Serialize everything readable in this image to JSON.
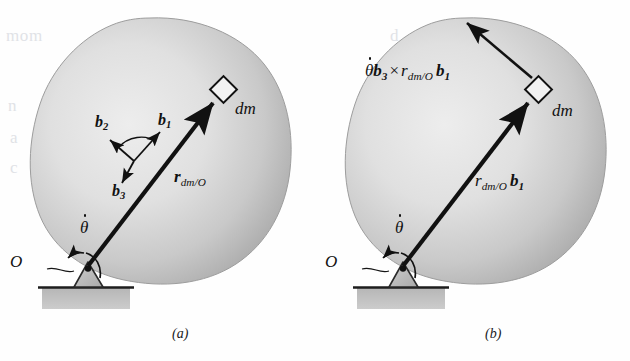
{
  "figure": {
    "kind": "physics-diagram",
    "panel_count": 2,
    "background_color": "#fefefe",
    "body_fill_light": "#e6e6e6",
    "body_fill_dark": "#a8a8a8",
    "body_edge_color": "#9a9a9a",
    "ink_color": "#111111",
    "ground_fill": "#b9b9b9",
    "support_fill": "#c4c4c4"
  },
  "panel_a": {
    "caption": "(a)",
    "origin_label": "O",
    "theta_dot": {
      "symbol": "θ",
      "accent": "dot",
      "meaning": "angular-rate"
    },
    "position_vector": {
      "r_symbol": "r",
      "r_bold": true,
      "subscript": "dm/O",
      "meaning": "position of dm relative to O"
    },
    "mass_element_label": "dm",
    "basis_vectors": [
      {
        "name": "b1",
        "symbol": "b",
        "index": "1"
      },
      {
        "name": "b2",
        "symbol": "b",
        "index": "2"
      },
      {
        "name": "b3",
        "symbol": "b",
        "index": "3"
      }
    ],
    "markers": {
      "dm_marker": "open-diamond",
      "pivot_marker": "filled-dot"
    }
  },
  "panel_b": {
    "caption": "(b)",
    "origin_label": "O",
    "theta_dot": {
      "symbol": "θ",
      "accent": "dot",
      "meaning": "angular-rate"
    },
    "position_vector": {
      "r_symbol": "r",
      "r_bold": false,
      "subscript": "dm/O",
      "unit_vector": "b",
      "unit_index": "1",
      "meaning": "r_dm/O b1"
    },
    "velocity_expression": {
      "theta_symbol": "θ",
      "theta_accent": "dot",
      "omega_unit": "b",
      "omega_index": "3",
      "cross": "×",
      "r_symbol": "r",
      "r_subscript": "dm/O",
      "r_unit": "b",
      "r_unit_index": "1",
      "meaning": "theta-dot b3 cross r_dm/O b1"
    },
    "mass_element_label": "dm",
    "markers": {
      "dm_marker": "open-diamond",
      "pivot_marker": "filled-dot"
    }
  },
  "bleed_through": {
    "note": "faint reverse-side scan text",
    "lines": [
      "mom",
      "n",
      "A",
      "c",
      "a",
      "d"
    ]
  }
}
